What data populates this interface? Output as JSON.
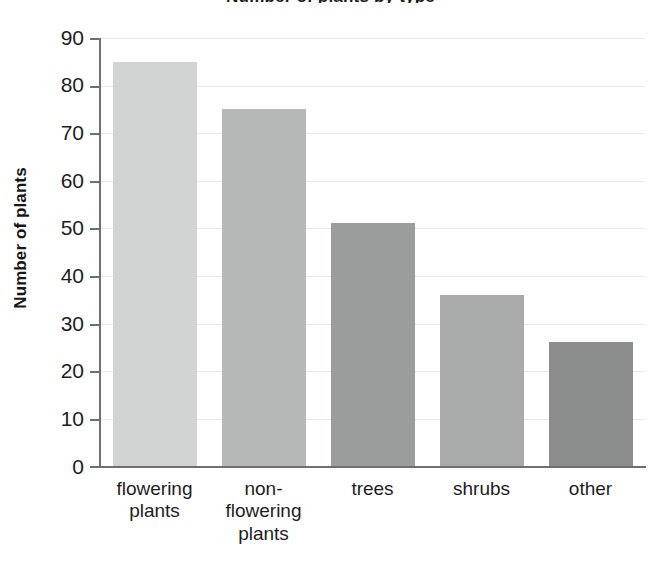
{
  "chart_data": {
    "type": "bar",
    "title": "Number of plants by type",
    "xlabel": "",
    "ylabel": "Number of plants",
    "categories": [
      "flowering plants",
      "non-flowering plants",
      "trees",
      "shrubs",
      "other"
    ],
    "category_lines": [
      [
        "flowering",
        "plants"
      ],
      [
        "non-",
        "flowering",
        "plants"
      ],
      [
        "trees"
      ],
      [
        "shrubs"
      ],
      [
        "other"
      ]
    ],
    "values": [
      85,
      75,
      51,
      36,
      26
    ],
    "ylim": [
      0,
      90
    ],
    "ytick_step": 10,
    "yticks": [
      "90",
      "80",
      "70",
      "60",
      "50",
      "40",
      "30",
      "20",
      "10",
      "0"
    ],
    "ytick_values": [
      90,
      80,
      70,
      60,
      50,
      40,
      30,
      20,
      10,
      0
    ],
    "grid": true,
    "legend": "none",
    "bar_colors": [
      "#d2d3d3",
      "#b6b7b7",
      "#9b9c9c",
      "#a9aaaa",
      "#8b8c8c"
    ],
    "axis_color": "#6f6f6f",
    "gridline_color": "#e9e9e9",
    "background_color": "#ffffff"
  }
}
